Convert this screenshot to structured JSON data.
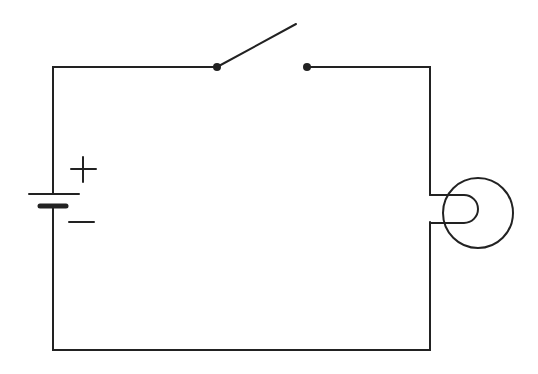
{
  "diagram": {
    "type": "circuit",
    "components": [
      {
        "id": "battery",
        "label_positive": "+",
        "label_negative": "−"
      },
      {
        "id": "switch",
        "state": "open"
      },
      {
        "id": "bulb"
      }
    ],
    "colors": {
      "stroke": "#222222",
      "background": "#ffffff"
    }
  }
}
